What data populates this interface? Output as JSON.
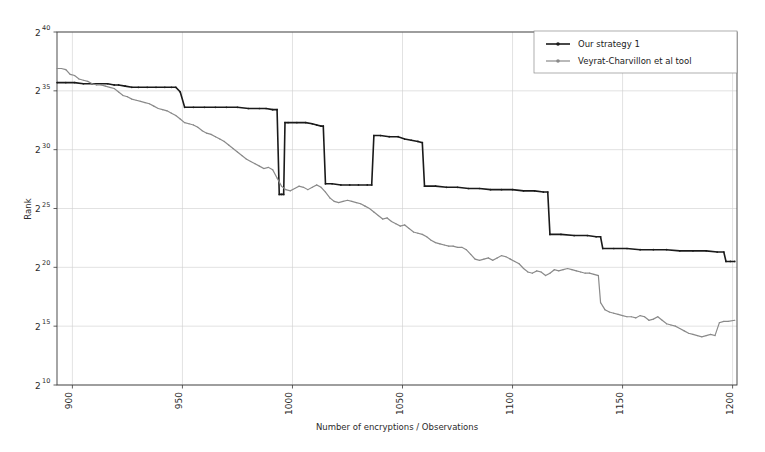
{
  "chart_data": {
    "type": "line",
    "title": "",
    "xlabel": "Number of encryptions / Observations",
    "ylabel": "Rank",
    "xlim": [
      893,
      1202
    ],
    "ylim": [
      10,
      40
    ],
    "yscale": "log2-exponent",
    "grid": true,
    "legend_position": "upper right",
    "xticks": [
      900,
      950,
      1000,
      1050,
      1100,
      1150,
      1200
    ],
    "xtick_labels": [
      "900",
      "950",
      "1000",
      "1050",
      "1100",
      "1150",
      "1200"
    ],
    "yticks": [
      10,
      15,
      20,
      25,
      30,
      35,
      40
    ],
    "ytick_labels": [
      "2",
      "2",
      "2",
      "2",
      "2",
      "2",
      "2"
    ],
    "ytick_exponents": [
      "10",
      "15",
      "20",
      "25",
      "30",
      "35",
      "40"
    ],
    "series": [
      {
        "name": "Our strategy 1",
        "color": "#1a1a1a",
        "marker": "dot",
        "points": [
          [
            893,
            35.7
          ],
          [
            897,
            35.7
          ],
          [
            901,
            35.7
          ],
          [
            905,
            35.6
          ],
          [
            909,
            35.6
          ],
          [
            913,
            35.6
          ],
          [
            916,
            35.6
          ],
          [
            919,
            35.5
          ],
          [
            921,
            35.5
          ],
          [
            924,
            35.4
          ],
          [
            927,
            35.3
          ],
          [
            930,
            35.3
          ],
          [
            934,
            35.3
          ],
          [
            938,
            35.3
          ],
          [
            942,
            35.3
          ],
          [
            945,
            35.3
          ],
          [
            947,
            35.3
          ],
          [
            949,
            34.9
          ],
          [
            951,
            33.6
          ],
          [
            955,
            33.6
          ],
          [
            960,
            33.6
          ],
          [
            965,
            33.6
          ],
          [
            970,
            33.6
          ],
          [
            975,
            33.6
          ],
          [
            980,
            33.5
          ],
          [
            985,
            33.5
          ],
          [
            988,
            33.5
          ],
          [
            991,
            33.4
          ],
          [
            993,
            33.4
          ],
          [
            994,
            26.2
          ],
          [
            995,
            26.2
          ],
          [
            996,
            26.2
          ],
          [
            996.6,
            32.3
          ],
          [
            998,
            32.3
          ],
          [
            1002,
            32.3
          ],
          [
            1006,
            32.3
          ],
          [
            1009,
            32.2
          ],
          [
            1011,
            32.1
          ],
          [
            1013,
            32.0
          ],
          [
            1014,
            32.0
          ],
          [
            1015,
            27.1
          ],
          [
            1018,
            27.1
          ],
          [
            1022,
            27.0
          ],
          [
            1026,
            27.0
          ],
          [
            1030,
            27.0
          ],
          [
            1034,
            27.0
          ],
          [
            1036,
            27.0
          ],
          [
            1037,
            31.2
          ],
          [
            1040,
            31.2
          ],
          [
            1044,
            31.1
          ],
          [
            1048,
            31.1
          ],
          [
            1051,
            30.9
          ],
          [
            1054,
            30.8
          ],
          [
            1057,
            30.7
          ],
          [
            1059,
            30.6
          ],
          [
            1060,
            26.9
          ],
          [
            1065,
            26.9
          ],
          [
            1070,
            26.8
          ],
          [
            1075,
            26.8
          ],
          [
            1080,
            26.7
          ],
          [
            1085,
            26.7
          ],
          [
            1090,
            26.6
          ],
          [
            1095,
            26.6
          ],
          [
            1100,
            26.6
          ],
          [
            1105,
            26.5
          ],
          [
            1110,
            26.5
          ],
          [
            1114,
            26.4
          ],
          [
            1116,
            26.4
          ],
          [
            1117,
            22.8
          ],
          [
            1122,
            22.8
          ],
          [
            1128,
            22.7
          ],
          [
            1134,
            22.7
          ],
          [
            1138,
            22.6
          ],
          [
            1140,
            22.6
          ],
          [
            1141,
            21.6
          ],
          [
            1146,
            21.6
          ],
          [
            1152,
            21.6
          ],
          [
            1158,
            21.5
          ],
          [
            1164,
            21.5
          ],
          [
            1170,
            21.5
          ],
          [
            1176,
            21.4
          ],
          [
            1182,
            21.4
          ],
          [
            1188,
            21.4
          ],
          [
            1193,
            21.3
          ],
          [
            1196,
            21.3
          ],
          [
            1197,
            20.5
          ],
          [
            1199,
            20.5
          ],
          [
            1201,
            20.5
          ]
        ]
      },
      {
        "name": "Veyrat-Charvillon et al tool",
        "color": "#8a8a8a",
        "marker": "dot",
        "points": [
          [
            893,
            36.9
          ],
          [
            895,
            36.9
          ],
          [
            897,
            36.8
          ],
          [
            899,
            36.4
          ],
          [
            901,
            36.3
          ],
          [
            903,
            36.0
          ],
          [
            905,
            35.9
          ],
          [
            907,
            35.8
          ],
          [
            909,
            35.6
          ],
          [
            911,
            35.5
          ],
          [
            913,
            35.5
          ],
          [
            915,
            35.4
          ],
          [
            917,
            35.3
          ],
          [
            919,
            35.2
          ],
          [
            921,
            34.9
          ],
          [
            923,
            34.6
          ],
          [
            925,
            34.5
          ],
          [
            927,
            34.3
          ],
          [
            929,
            34.2
          ],
          [
            931,
            34.1
          ],
          [
            933,
            34.0
          ],
          [
            935,
            33.9
          ],
          [
            937,
            33.7
          ],
          [
            939,
            33.5
          ],
          [
            941,
            33.4
          ],
          [
            943,
            33.3
          ],
          [
            945,
            33.1
          ],
          [
            947,
            32.9
          ],
          [
            949,
            32.6
          ],
          [
            951,
            32.3
          ],
          [
            953,
            32.2
          ],
          [
            955,
            32.1
          ],
          [
            957,
            31.9
          ],
          [
            959,
            31.6
          ],
          [
            961,
            31.4
          ],
          [
            963,
            31.3
          ],
          [
            965,
            31.1
          ],
          [
            967,
            30.9
          ],
          [
            969,
            30.7
          ],
          [
            971,
            30.4
          ],
          [
            973,
            30.1
          ],
          [
            975,
            29.8
          ],
          [
            977,
            29.5
          ],
          [
            979,
            29.2
          ],
          [
            981,
            29.0
          ],
          [
            983,
            28.8
          ],
          [
            985,
            28.6
          ],
          [
            987,
            28.4
          ],
          [
            989,
            28.5
          ],
          [
            991,
            28.3
          ],
          [
            993,
            27.6
          ],
          [
            995,
            26.9
          ],
          [
            997,
            26.6
          ],
          [
            999,
            26.5
          ],
          [
            1001,
            26.7
          ],
          [
            1003,
            26.9
          ],
          [
            1005,
            26.8
          ],
          [
            1007,
            26.6
          ],
          [
            1009,
            26.8
          ],
          [
            1011,
            27.0
          ],
          [
            1013,
            26.8
          ],
          [
            1015,
            26.4
          ],
          [
            1017,
            25.9
          ],
          [
            1019,
            25.6
          ],
          [
            1021,
            25.5
          ],
          [
            1023,
            25.6
          ],
          [
            1025,
            25.7
          ],
          [
            1027,
            25.6
          ],
          [
            1029,
            25.5
          ],
          [
            1031,
            25.4
          ],
          [
            1033,
            25.2
          ],
          [
            1035,
            25.0
          ],
          [
            1037,
            24.7
          ],
          [
            1039,
            24.4
          ],
          [
            1041,
            24.1
          ],
          [
            1043,
            24.2
          ],
          [
            1045,
            23.9
          ],
          [
            1047,
            23.7
          ],
          [
            1049,
            23.5
          ],
          [
            1051,
            23.6
          ],
          [
            1053,
            23.3
          ],
          [
            1055,
            23.0
          ],
          [
            1057,
            22.9
          ],
          [
            1059,
            22.8
          ],
          [
            1061,
            22.6
          ],
          [
            1063,
            22.3
          ],
          [
            1065,
            22.1
          ],
          [
            1067,
            22.0
          ],
          [
            1069,
            21.9
          ],
          [
            1071,
            21.8
          ],
          [
            1073,
            21.8
          ],
          [
            1075,
            21.7
          ],
          [
            1077,
            21.7
          ],
          [
            1079,
            21.5
          ],
          [
            1081,
            21.1
          ],
          [
            1083,
            20.7
          ],
          [
            1085,
            20.6
          ],
          [
            1087,
            20.7
          ],
          [
            1089,
            20.8
          ],
          [
            1091,
            20.6
          ],
          [
            1093,
            20.8
          ],
          [
            1095,
            21.0
          ],
          [
            1097,
            20.9
          ],
          [
            1099,
            20.7
          ],
          [
            1101,
            20.5
          ],
          [
            1103,
            20.3
          ],
          [
            1105,
            19.9
          ],
          [
            1107,
            19.6
          ],
          [
            1109,
            19.5
          ],
          [
            1111,
            19.7
          ],
          [
            1113,
            19.6
          ],
          [
            1115,
            19.3
          ],
          [
            1117,
            19.5
          ],
          [
            1119,
            19.8
          ],
          [
            1121,
            19.7
          ],
          [
            1123,
            19.8
          ],
          [
            1125,
            19.9
          ],
          [
            1127,
            19.8
          ],
          [
            1129,
            19.7
          ],
          [
            1131,
            19.6
          ],
          [
            1133,
            19.5
          ],
          [
            1135,
            19.5
          ],
          [
            1137,
            19.4
          ],
          [
            1139,
            19.3
          ],
          [
            1140,
            17.0
          ],
          [
            1142,
            16.4
          ],
          [
            1144,
            16.2
          ],
          [
            1146,
            16.1
          ],
          [
            1148,
            16.0
          ],
          [
            1150,
            15.9
          ],
          [
            1152,
            15.8
          ],
          [
            1154,
            15.8
          ],
          [
            1156,
            15.7
          ],
          [
            1158,
            15.9
          ],
          [
            1160,
            15.8
          ],
          [
            1162,
            15.5
          ],
          [
            1164,
            15.6
          ],
          [
            1166,
            15.8
          ],
          [
            1168,
            15.5
          ],
          [
            1170,
            15.2
          ],
          [
            1172,
            15.1
          ],
          [
            1174,
            15.0
          ],
          [
            1176,
            14.8
          ],
          [
            1178,
            14.6
          ],
          [
            1180,
            14.4
          ],
          [
            1182,
            14.3
          ],
          [
            1184,
            14.2
          ],
          [
            1186,
            14.1
          ],
          [
            1188,
            14.2
          ],
          [
            1190,
            14.3
          ],
          [
            1192,
            14.2
          ],
          [
            1194,
            15.3
          ],
          [
            1196,
            15.4
          ],
          [
            1198,
            15.4
          ],
          [
            1201,
            15.5
          ]
        ]
      }
    ]
  },
  "legend": {
    "entries": [
      {
        "label": "Our strategy 1",
        "color": "#1a1a1a"
      },
      {
        "label": "Veyrat-Charvillon et al tool",
        "color": "#8a8a8a"
      }
    ]
  },
  "axes": {
    "y_label": "Rank",
    "x_label": "Number of encryptions / Observations",
    "base": "2"
  }
}
